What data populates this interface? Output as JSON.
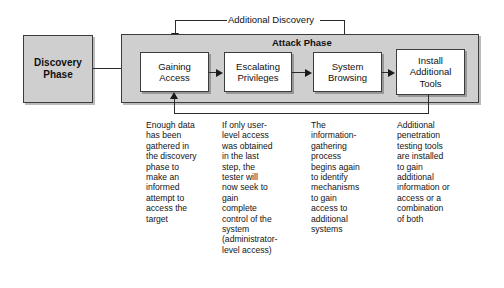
{
  "diagram": {
    "title_label": "Additional Discovery",
    "attack_phase_label": "Attack Phase",
    "discovery_phase_label": "Discovery\nPhase",
    "steps": [
      {
        "id": "gaining-access",
        "label": "Gaining\nAccess"
      },
      {
        "id": "escalating-privileges",
        "label": "Escalating\nPrivileges"
      },
      {
        "id": "system-browsing",
        "label": "System\nBrowsing"
      },
      {
        "id": "install-additional-tools",
        "label": "Install\nAdditional\nTools"
      }
    ],
    "notes": [
      {
        "id": "note-gaining-access",
        "text": "Enough data\nhas been\ngathered in\nthe discovery\nphase to\nmake an\ninformed\nattempt to\naccess the\ntarget"
      },
      {
        "id": "note-escalating-privileges",
        "text": "If only user-\nlevel access\nwas obtained\nin the last\nstep, the\ntester will\nnow seek to\ngain\ncomplete\ncontrol of the\nsystem\n(administrator-\nlevel access)"
      },
      {
        "id": "note-system-browsing",
        "text": "The\ninformation-\ngathering\nprocess\nbegins again\nto identify\nmechanisms\nto gain\naccess to\nadditional\nsystems"
      },
      {
        "id": "note-install-additional-tools",
        "text": "Additional\npenetration\ntesting tools\nare installed\nto gain\nadditional\ninformation or\naccess or a\ncombination\nof both"
      }
    ],
    "colors": {
      "phase_fill": "#cfcfcf",
      "step_fill": "#ffffff",
      "line": "#2b2b2b",
      "text": "#111111",
      "background": "#ffffff"
    }
  }
}
